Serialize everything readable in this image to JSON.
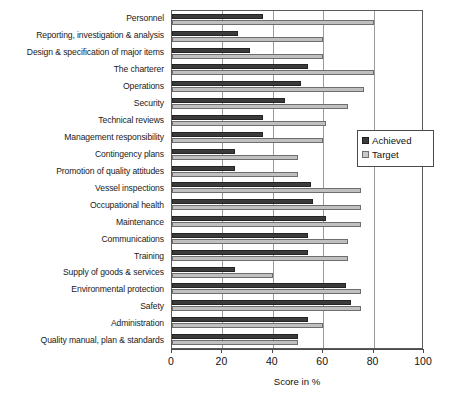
{
  "chart_data": {
    "type": "bar",
    "orientation": "horizontal",
    "title": "",
    "xlabel": "Score in %",
    "ylabel": "",
    "xlim": [
      0,
      100
    ],
    "xticks": [
      0,
      20,
      40,
      60,
      80,
      100
    ],
    "grid": true,
    "legend_position": "right-middle",
    "legend": [
      "Achieved",
      "Target"
    ],
    "colors": {
      "achieved": "#3b3b3b",
      "target": "#c0c0c0",
      "axis": "#4a4a4a",
      "grid": "#9a9a9a",
      "background": "#ffffff"
    },
    "categories": [
      "Personnel",
      "Reporting, investigation & analysis",
      "Design & specification of major items",
      "The charterer",
      "Operations",
      "Security",
      "Technical reviews",
      "Management responsibility",
      "Contingency plans",
      "Promotion of quality attitudes",
      "Vessel inspections",
      "Occupational health",
      "Maintenance",
      "Communications",
      "Training",
      "Supply of goods & services",
      "Environmental protection",
      "Safety",
      "Administration",
      "Quality manual, plan & standards"
    ],
    "series": [
      {
        "name": "Achieved",
        "values": [
          36,
          26,
          31,
          54,
          51,
          45,
          36,
          36,
          25,
          25,
          55,
          56,
          61,
          54,
          54,
          25,
          69,
          71,
          54,
          50
        ]
      },
      {
        "name": "Target",
        "values": [
          80,
          60,
          60,
          80,
          76,
          70,
          61,
          60,
          50,
          50,
          75,
          75,
          75,
          70,
          70,
          40,
          75,
          75,
          60,
          50
        ]
      }
    ]
  }
}
